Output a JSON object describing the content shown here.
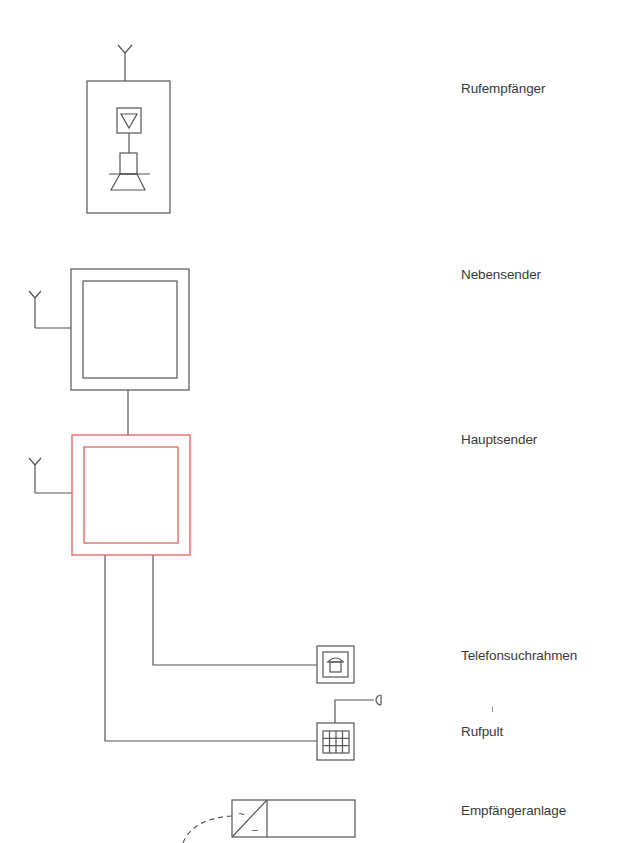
{
  "diagram": {
    "colors": {
      "line": "#555555",
      "accent": "#e2605f"
    },
    "components": [
      {
        "id": "rufempfaenger",
        "label": "Rufempfänger",
        "icons": [
          "antenna-icon",
          "amplifier-icon",
          "speaker-icon"
        ]
      },
      {
        "id": "nebensender",
        "label": "Nebensender",
        "icons": [
          "antenna-icon"
        ]
      },
      {
        "id": "hauptsender",
        "label": "Hauptsender",
        "icons": [
          "antenna-icon"
        ],
        "highlight": true
      },
      {
        "id": "telefonsuchrahmen",
        "label": "Telefonsuchrahmen",
        "icons": [
          "telephone-icon"
        ]
      },
      {
        "id": "rufpult",
        "label": "Rufpult",
        "icons": [
          "keypad-icon",
          "microphone-icon"
        ]
      },
      {
        "id": "empfaengeranlage",
        "label": "Empfängeranlage",
        "icons": [
          "ac-dc-converter-icon"
        ],
        "symbols": [
          "~",
          "–"
        ]
      }
    ]
  }
}
